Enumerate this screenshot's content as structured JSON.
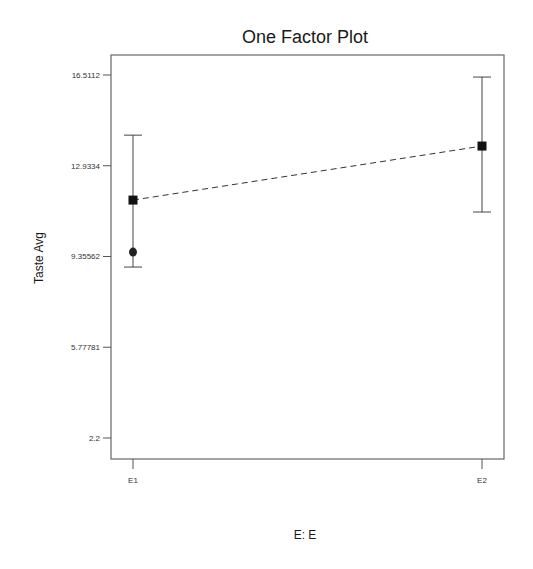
{
  "chart_data": {
    "type": "line",
    "title": "One Factor Plot",
    "xlabel": "E: E",
    "ylabel": "Taste Avg",
    "categories": [
      "E1",
      "E2"
    ],
    "y_ticks": [
      16.5112,
      12.9334,
      9.35562,
      5.77781,
      2.2
    ],
    "y_tick_labels": [
      "16.5112",
      "12.9334",
      "9.35562",
      "5.77781",
      "2.2"
    ],
    "ylim": [
      1.3,
      17.5
    ],
    "grid": false,
    "legend": null,
    "series": [
      {
        "name": "Predicted mean",
        "marker": "square",
        "line": "dashed",
        "values": [
          11.58,
          13.71
        ]
      },
      {
        "name": "Observed design point",
        "marker": "circle",
        "values": [
          9.53,
          null
        ]
      }
    ],
    "error_bars": [
      {
        "category": "E1",
        "lower": 8.94,
        "upper": 14.14
      },
      {
        "category": "E2",
        "lower": 11.11,
        "upper": 16.43
      }
    ]
  },
  "layout": {
    "plot": {
      "left": 111,
      "top": 55,
      "right": 504,
      "bottom": 459
    },
    "y_pixel_top_tick": 75,
    "y_pixel_bottom_tick": 438,
    "x_pixels": [
      133,
      482
    ],
    "colors": {
      "marker": "#111111",
      "frame": "#666666",
      "text": "#1a1a1a"
    }
  }
}
